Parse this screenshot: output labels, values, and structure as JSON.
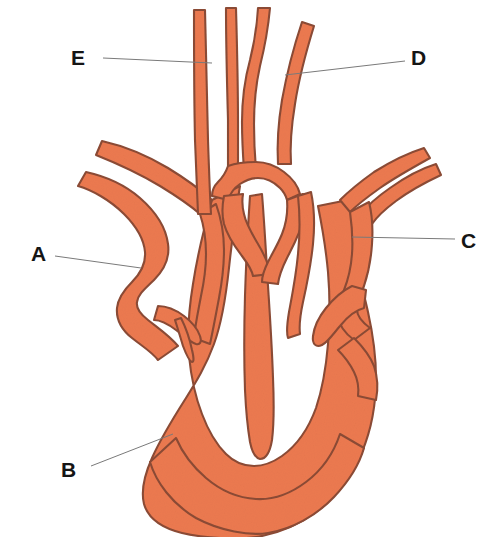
{
  "diagram": {
    "view": "coronal section",
    "colors": {
      "fill": "#EC7A50",
      "outline": "#8C4B35",
      "leader_line": "#7A7A7A",
      "label_text": "#151515",
      "background": "#FFFFFF"
    },
    "labels": [
      {
        "id": "E",
        "text": "E",
        "position": {
          "x": 71,
          "y": 47
        },
        "leader": {
          "x1": 103,
          "y1": 58,
          "x2": 212,
          "y2": 63
        },
        "points_to": "upper-left-great-vessel"
      },
      {
        "id": "D",
        "text": "D",
        "position": {
          "x": 411,
          "y": 47
        },
        "leader": {
          "x1": 405,
          "y1": 61,
          "x2": 285,
          "y2": 75
        },
        "points_to": "upper-right-great-vessel"
      },
      {
        "id": "A",
        "text": "A",
        "position": {
          "x": 31,
          "y": 243
        },
        "leader": {
          "x1": 55,
          "y1": 256,
          "x2": 141,
          "y2": 268
        },
        "points_to": "left-side-vessel-wall"
      },
      {
        "id": "C",
        "text": "C",
        "position": {
          "x": 461,
          "y": 230
        },
        "leader": {
          "x1": 455,
          "y1": 239,
          "x2": 352,
          "y2": 237
        },
        "points_to": "right-side-chamber-wall"
      },
      {
        "id": "B",
        "text": "B",
        "position": {
          "x": 61,
          "y": 459
        },
        "leader": {
          "x1": 91,
          "y1": 466,
          "x2": 173,
          "y2": 434
        },
        "points_to": "lower-left-ventricular-wall"
      }
    ]
  }
}
